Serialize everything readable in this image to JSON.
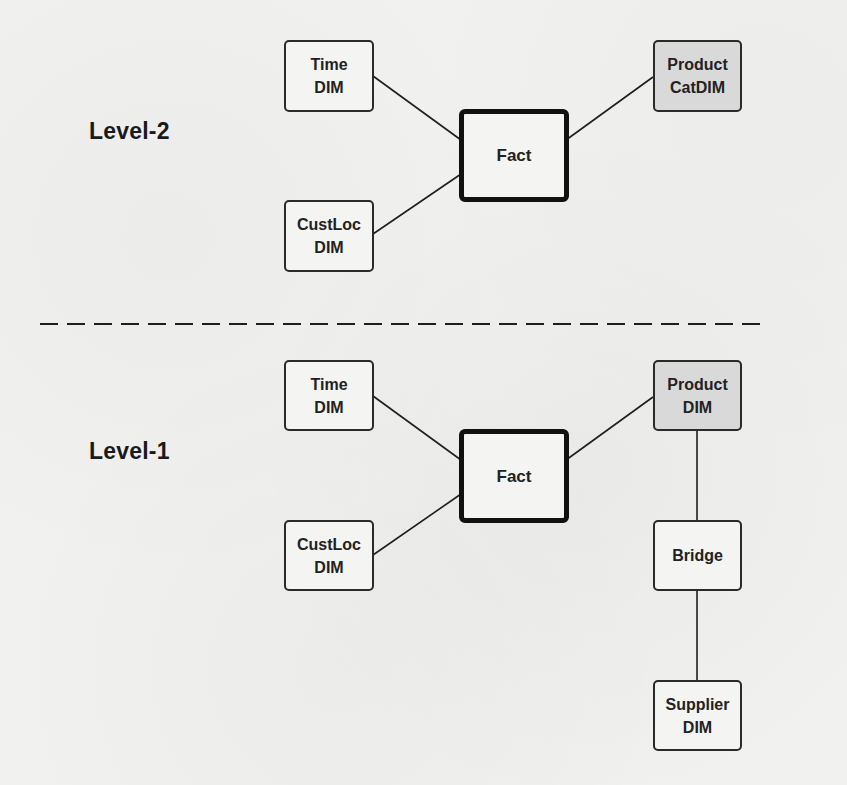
{
  "diagram": {
    "colors": {
      "line": "#1e1e1e",
      "box_border": "#2a2a2a",
      "box_fill": "#f4f4f3",
      "shaded_fill": "#d9d9d9",
      "background": "#f1f1f0"
    },
    "separator": {
      "style": "dashed",
      "y": 324
    },
    "levels": [
      {
        "label": "Level-2",
        "nodes": {
          "time": {
            "line1": "Time",
            "line2": "DIM"
          },
          "fact": {
            "line1": "Fact"
          },
          "product": {
            "line1": "Product",
            "line2": "CatDIM",
            "shaded": true
          },
          "custloc": {
            "line1": "CustLoc",
            "line2": "DIM"
          }
        },
        "edges": [
          [
            "Time DIM",
            "Fact"
          ],
          [
            "CustLoc DIM",
            "Fact"
          ],
          [
            "Fact",
            "Product CatDIM"
          ]
        ]
      },
      {
        "label": "Level-1",
        "nodes": {
          "time": {
            "line1": "Time",
            "line2": "DIM"
          },
          "fact": {
            "line1": "Fact"
          },
          "product": {
            "line1": "Product",
            "line2": "DIM",
            "shaded": true
          },
          "custloc": {
            "line1": "CustLoc",
            "line2": "DIM"
          },
          "bridge": {
            "line1": "Bridge"
          },
          "supplier": {
            "line1": "Supplier",
            "line2": "DIM"
          }
        },
        "edges": [
          [
            "Time DIM",
            "Fact"
          ],
          [
            "CustLoc DIM",
            "Fact"
          ],
          [
            "Fact",
            "Product DIM"
          ],
          [
            "Product DIM",
            "Bridge"
          ],
          [
            "Bridge",
            "Supplier DIM"
          ]
        ]
      }
    ]
  }
}
